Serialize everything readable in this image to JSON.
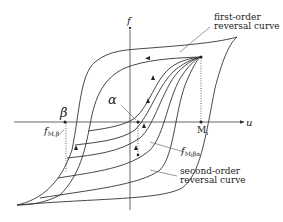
{
  "diagram": {
    "type": "hysteresis reversal curves",
    "axes": {
      "x_label": "u",
      "y_label": "f"
    },
    "points": {
      "alpha": "α",
      "beta": "β",
      "Mi": "M",
      "Mi_sub": "i"
    },
    "labels": {
      "first_order_line1": "first-order",
      "first_order_line2": "reversal curve",
      "second_order_line1": "second-order",
      "second_order_line2": "reversal curve",
      "f_M_beta": "f",
      "f_M_beta_sub": "M,β",
      "f_Mi_beta_alpha": "f",
      "f_Mi_beta_alpha_sub": "M",
      "f_Mi_beta_alpha_sub2": "i",
      "f_Mi_beta_alpha_sub3": "βα"
    },
    "colors": {
      "line": "#333333",
      "background": "#ffffff"
    }
  }
}
